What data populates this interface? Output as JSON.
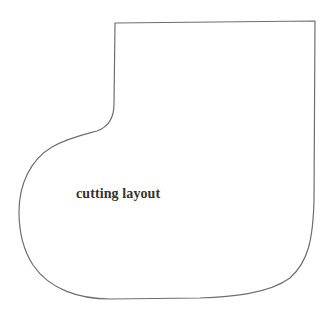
{
  "diagram": {
    "shape": "boot-pattern-outline",
    "label": "cutting layout",
    "stroke_color": "#6e6e6e",
    "stroke_width": 1.2,
    "background_color": "#ffffff"
  }
}
